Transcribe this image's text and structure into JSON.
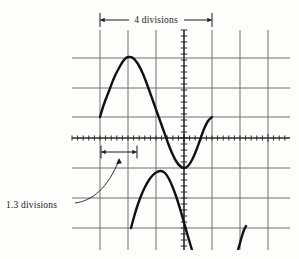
{
  "figure": {
    "background_color": "#fdfdfb",
    "annotations": {
      "top_measure_label": "4 divisions",
      "left_measure_label": "1.3 divisions"
    }
  },
  "graticule": {
    "line_color": "#6e6e6e",
    "axis_color": "#2b2b2b",
    "vertical_gridlines_x": [
      100,
      128,
      156,
      184,
      212,
      240,
      268
    ],
    "horizontal_gridlines_y": [
      58,
      88,
      117,
      138,
      168,
      198,
      228
    ],
    "x_axis_y": 138,
    "y_axis_x": 184,
    "plot_left": 72,
    "plot_right": 290,
    "plot_top": 30,
    "plot_bottom": 250,
    "x_tick_spacing": 5.6,
    "y_tick_spacing": 6.0,
    "divisions_x": 4,
    "divisions_measured": 1.3
  },
  "chart_data": {
    "type": "line",
    "title": "",
    "subtitle": "",
    "xlabel": "",
    "ylabel": "",
    "grid": true,
    "legend_position": "none",
    "axis_style": "oscilloscope-graticule",
    "xlim": [
      72,
      290
    ],
    "ylim": [
      250,
      30
    ],
    "annotations": [
      {
        "text": "4 divisions",
        "type": "double-arrow-horizontal",
        "x_start": 100,
        "x_end": 212,
        "y": 20,
        "span_divisions": 4
      },
      {
        "text": "1.3 divisions",
        "type": "double-arrow-horizontal-with-leader",
        "x_start": 101,
        "x_end": 137,
        "y": 152,
        "span_divisions": 1.3,
        "label_x": 8,
        "label_y": 205
      }
    ],
    "series": [
      {
        "name": "main-waveform",
        "color": "#111111",
        "width": 2.4,
        "points": [
          [
            100,
            117
          ],
          [
            104,
            104
          ],
          [
            109,
            91
          ],
          [
            114,
            78
          ],
          [
            119,
            68
          ],
          [
            124,
            60
          ],
          [
            128,
            57
          ],
          [
            133,
            58
          ],
          [
            138,
            64
          ],
          [
            143,
            74
          ],
          [
            148,
            87
          ],
          [
            153,
            101
          ],
          [
            158,
            115
          ],
          [
            163,
            129
          ],
          [
            168,
            143
          ],
          [
            172,
            153
          ],
          [
            176,
            161
          ],
          [
            180,
            166
          ],
          [
            184,
            168
          ],
          [
            188,
            166
          ],
          [
            192,
            160
          ],
          [
            196,
            151
          ],
          [
            200,
            140
          ],
          [
            204,
            129
          ],
          [
            208,
            121
          ],
          [
            212,
            117
          ]
        ]
      },
      {
        "name": "second-waveform-lower",
        "color": "#111111",
        "width": 2.4,
        "points": [
          [
            131,
            228
          ],
          [
            134,
            217
          ],
          [
            137,
            207
          ],
          [
            141,
            196
          ],
          [
            145,
            187
          ],
          [
            149,
            180
          ],
          [
            153,
            175
          ],
          [
            157,
            172
          ],
          [
            161,
            171
          ],
          [
            165,
            173
          ],
          [
            169,
            179
          ],
          [
            173,
            188
          ],
          [
            177,
            199
          ],
          [
            181,
            212
          ],
          [
            185,
            226
          ],
          [
            189,
            240
          ],
          [
            192,
            250
          ]
        ]
      },
      {
        "name": "third-waveform-fragment",
        "color": "#111111",
        "width": 2.4,
        "points": [
          [
            238,
            250
          ],
          [
            240,
            243
          ],
          [
            242,
            236
          ],
          [
            244,
            230
          ],
          [
            246,
            226
          ]
        ]
      }
    ]
  }
}
